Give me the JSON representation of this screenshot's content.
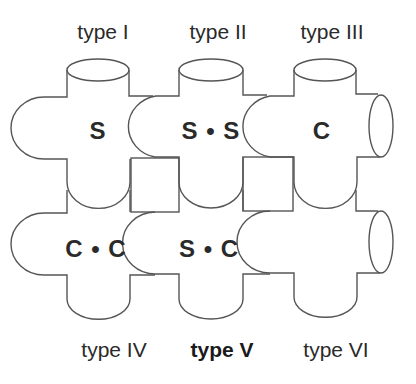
{
  "diagram": {
    "stroke_color": "#555555",
    "text_color": "#2a2a2a",
    "top_labels": [
      "type I",
      "type II",
      "type III"
    ],
    "bottom_labels": [
      "type IV",
      "type V",
      "type VI"
    ],
    "highlighted_label": "type V",
    "pieces": [
      {
        "type": "type I",
        "center_text": "S"
      },
      {
        "type": "type II",
        "center_text": "S • S"
      },
      {
        "type": "type III",
        "center_text": "C"
      },
      {
        "type": "type IV",
        "center_text": "C • C"
      },
      {
        "type": "type V",
        "center_text": "S • C"
      },
      {
        "type": "type VI",
        "center_text": ""
      }
    ]
  }
}
